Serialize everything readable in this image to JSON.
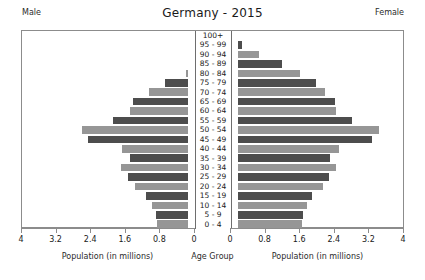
{
  "header": {
    "title": "Germany - 2015",
    "male_label": "Male",
    "female_label": "Female"
  },
  "axis": {
    "left_caption": "Population (in millions)",
    "center_caption": "Age Group",
    "right_caption": "Population (in millions)",
    "tick_labels": [
      "4",
      "3.2",
      "2.4",
      "1.6",
      "0.8",
      "0"
    ],
    "tick_labels_right": [
      "0",
      "0.8",
      "1.6",
      "2.4",
      "3.2",
      "4"
    ]
  },
  "colors": {
    "bar_dark": "#4d4d4d",
    "bar_light": "#969696",
    "frame": "#8c8c8c",
    "background": "#ffffff",
    "text": "#1a1a1a"
  },
  "chart_data": {
    "type": "bar",
    "title": "Germany - 2015",
    "subtitle": "",
    "xlabel": "Population (in millions)",
    "ylabel": "Age Group",
    "xlim": [
      0,
      4
    ],
    "grid": false,
    "legend": [
      "Male",
      "Female"
    ],
    "legend_position": "top-corners",
    "orientation": "horizontal-diverging",
    "categories": [
      "100+",
      "95 - 99",
      "90 - 94",
      "85 - 89",
      "80 - 84",
      "75 - 79",
      "70 - 74",
      "65 - 69",
      "60 - 64",
      "55 - 59",
      "50 - 54",
      "45 - 49",
      "40 - 44",
      "35 - 39",
      "30 - 34",
      "25 - 29",
      "20 - 24",
      "15 - 19",
      "10 - 14",
      "5 - 9",
      "0 - 4"
    ],
    "series": [
      {
        "name": "Male",
        "values": [
          0.01,
          0.09,
          0.28,
          0.7,
          1.06,
          1.55,
          1.92,
          2.29,
          2.35,
          2.76,
          3.46,
          3.32,
          2.55,
          2.35,
          2.57,
          2.41,
          2.25,
          1.98,
          1.85,
          1.75,
          1.73
        ]
      },
      {
        "name": "Female",
        "values": [
          0.04,
          0.26,
          0.64,
          1.18,
          1.6,
          1.97,
          2.18,
          2.41,
          2.43,
          2.79,
          3.42,
          3.26,
          2.5,
          2.28,
          2.43,
          2.26,
          2.12,
          1.87,
          1.75,
          1.66,
          1.64
        ]
      }
    ]
  }
}
